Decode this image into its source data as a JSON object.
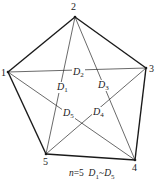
{
  "diagram": {
    "n": 5,
    "vertices": [
      {
        "id": "1",
        "label": "1",
        "x": 8,
        "y": 72,
        "lx": 1,
        "ly": 76
      },
      {
        "id": "2",
        "label": "2",
        "x": 75,
        "y": 17,
        "lx": 71,
        "ly": 10
      },
      {
        "id": "3",
        "label": "3",
        "x": 146,
        "y": 68,
        "lx": 149,
        "ly": 72
      },
      {
        "id": "4",
        "label": "4",
        "x": 135,
        "y": 160,
        "lx": 132,
        "ly": 171
      },
      {
        "id": "5",
        "label": "5",
        "x": 46,
        "y": 154,
        "lx": 43,
        "ly": 165
      }
    ],
    "edges": [
      [
        "1",
        "2"
      ],
      [
        "2",
        "3"
      ],
      [
        "3",
        "4"
      ],
      [
        "4",
        "5"
      ],
      [
        "5",
        "1"
      ]
    ],
    "diagonals": [
      {
        "name": "D1",
        "main": "D",
        "sub": "1",
        "from": "2",
        "to": "5",
        "lx": 57,
        "ly": 90
      },
      {
        "name": "D2",
        "main": "D",
        "sub": "2",
        "from": "1",
        "to": "3",
        "lx": 73,
        "ly": 75
      },
      {
        "name": "D3",
        "main": "D",
        "sub": "3",
        "from": "2",
        "to": "4",
        "lx": 98,
        "ly": 88
      },
      {
        "name": "D4",
        "main": "D",
        "sub": "4",
        "from": "3",
        "to": "5",
        "lx": 93,
        "ly": 115
      },
      {
        "name": "D5",
        "main": "D",
        "sub": "5",
        "from": "1",
        "to": "4",
        "lx": 63,
        "ly": 116
      }
    ],
    "caption": {
      "n_label": "n",
      "equals": "=5",
      "range_start_main": "D",
      "range_start_sub": "1",
      "tilde": "~",
      "range_end_main": "D",
      "range_end_sub": "5"
    }
  }
}
